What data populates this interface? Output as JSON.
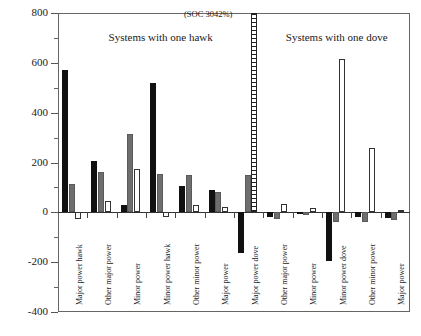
{
  "chart_data": {
    "type": "bar",
    "title": "",
    "xlabel": "",
    "ylabel": "Percentage Change from Baseline",
    "ylim": [
      -400,
      800
    ],
    "ytick_labels": [
      "800",
      "600",
      "400",
      "200",
      "0",
      "-200",
      "-400"
    ],
    "ytick_values": [
      800,
      600,
      400,
      200,
      0,
      -200,
      -400
    ],
    "grid": false,
    "legend_position": "none",
    "annotations": [
      {
        "text": "(SOC 3042%)",
        "category": "Major power dove",
        "series": "White",
        "value": 3042
      }
    ],
    "section_labels": [
      {
        "text": "Systems with one hawk",
        "categories": 7
      },
      {
        "text": "Systems with one dove",
        "categories": 5
      }
    ],
    "categories": [
      "Major power hawk",
      "Other major power",
      "Minor power",
      "Minor power hawk",
      "Other minor power",
      "Major power",
      "Major power dove",
      "Other major power",
      "Minor power",
      "Minor power dove",
      "Other minor power",
      "Major power"
    ],
    "series": [
      {
        "name": "Black",
        "values": [
          570,
          205,
          30,
          520,
          105,
          90,
          -165,
          -18,
          -8,
          -195,
          -20,
          -22
        ]
      },
      {
        "name": "Gray",
        "values": [
          115,
          160,
          315,
          155,
          150,
          80,
          150,
          -28,
          -10,
          -40,
          -38,
          -30
        ]
      },
      {
        "name": "White",
        "values": [
          -25,
          45,
          175,
          -18,
          30,
          22,
          3042,
          32,
          18,
          615,
          260,
          8
        ]
      }
    ]
  }
}
